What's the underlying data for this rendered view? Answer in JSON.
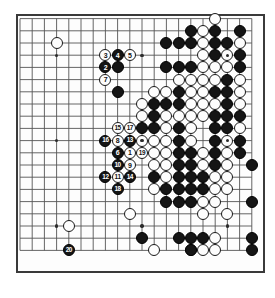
{
  "diagram": {
    "kind": "go-board-game-record",
    "board_size": 20,
    "origin_x": 20.0,
    "origin_y": 18.6,
    "spacing": 12.2,
    "stone_radius": 6.0,
    "colors": {
      "black": "#151515",
      "white": "#fdfdfd",
      "line": "#555555",
      "border": "#3a3a3a",
      "background": "#ffffff"
    },
    "star_points": [
      {
        "col": 3,
        "row": 3
      },
      {
        "col": 10,
        "row": 3
      },
      {
        "col": 17,
        "row": 3
      },
      {
        "col": 3,
        "row": 10
      },
      {
        "col": 10,
        "row": 10
      },
      {
        "col": 17,
        "row": 10
      },
      {
        "col": 3,
        "row": 17
      },
      {
        "col": 10,
        "row": 17
      },
      {
        "col": 17,
        "row": 17
      }
    ],
    "moves": [
      {
        "n": "1",
        "color": "w",
        "col": 9,
        "row": 11
      },
      {
        "n": "2",
        "color": "b",
        "col": 7,
        "row": 4
      },
      {
        "n": "3",
        "color": "w",
        "col": 7,
        "row": 3
      },
      {
        "n": "4",
        "color": "b",
        "col": 8,
        "row": 3
      },
      {
        "n": "5",
        "color": "w",
        "col": 9,
        "row": 3
      },
      {
        "n": "6",
        "color": "b",
        "col": 8,
        "row": 11
      },
      {
        "n": "7",
        "color": "w",
        "col": 7,
        "row": 5
      },
      {
        "n": "8",
        "color": "w",
        "col": 8,
        "row": 10
      },
      {
        "n": "9",
        "color": "w",
        "col": 9,
        "row": 12
      },
      {
        "n": "10",
        "color": "b",
        "col": 8,
        "row": 12
      },
      {
        "n": "11",
        "color": "w",
        "col": 8,
        "row": 13
      },
      {
        "n": "12",
        "color": "b",
        "col": 7,
        "row": 13
      },
      {
        "n": "13",
        "color": "b",
        "col": 9,
        "row": 10
      },
      {
        "n": "14",
        "color": "b",
        "col": 9,
        "row": 13
      },
      {
        "n": "15",
        "color": "w",
        "col": 8,
        "row": 9
      },
      {
        "n": "16",
        "color": "b",
        "col": 7,
        "row": 10
      },
      {
        "n": "17",
        "color": "w",
        "col": 9,
        "row": 9
      },
      {
        "n": "18",
        "color": "b",
        "col": 8,
        "row": 14
      },
      {
        "n": "19",
        "color": "w",
        "col": 10,
        "row": 11
      },
      {
        "n": "20",
        "color": "b",
        "col": 4,
        "row": 19
      }
    ],
    "stones": [
      {
        "color": "w",
        "col": 3,
        "row": 2
      },
      {
        "color": "w",
        "col": 16,
        "row": 0
      },
      {
        "color": "b",
        "col": 14,
        "row": 1
      },
      {
        "color": "w",
        "col": 15,
        "row": 1
      },
      {
        "color": "b",
        "col": 16,
        "row": 1
      },
      {
        "color": "b",
        "col": 18,
        "row": 1
      },
      {
        "color": "b",
        "col": 12,
        "row": 2
      },
      {
        "color": "b",
        "col": 13,
        "row": 2
      },
      {
        "color": "b",
        "col": 14,
        "row": 2
      },
      {
        "color": "w",
        "col": 15,
        "row": 2
      },
      {
        "color": "b",
        "col": 16,
        "row": 2
      },
      {
        "color": "b",
        "col": 17,
        "row": 2
      },
      {
        "color": "w",
        "col": 18,
        "row": 2
      },
      {
        "color": "b",
        "col": 8,
        "row": 4
      },
      {
        "color": "w",
        "col": 15,
        "row": 3
      },
      {
        "color": "b",
        "col": 16,
        "row": 3
      },
      {
        "color": "w",
        "col": 17,
        "row": 3
      },
      {
        "color": "b",
        "col": 18,
        "row": 3
      },
      {
        "color": "b",
        "col": 12,
        "row": 4
      },
      {
        "color": "b",
        "col": 13,
        "row": 4
      },
      {
        "color": "b",
        "col": 14,
        "row": 4
      },
      {
        "color": "w",
        "col": 15,
        "row": 4
      },
      {
        "color": "w",
        "col": 16,
        "row": 4
      },
      {
        "color": "w",
        "col": 17,
        "row": 4
      },
      {
        "color": "b",
        "col": 18,
        "row": 4
      },
      {
        "color": "b",
        "col": 8,
        "row": 6
      },
      {
        "color": "w",
        "col": 13,
        "row": 5
      },
      {
        "color": "w",
        "col": 14,
        "row": 5
      },
      {
        "color": "w",
        "col": 15,
        "row": 5
      },
      {
        "color": "w",
        "col": 16,
        "row": 5
      },
      {
        "color": "b",
        "col": 17,
        "row": 5
      },
      {
        "color": "w",
        "col": 18,
        "row": 5
      },
      {
        "color": "w",
        "col": 11,
        "row": 6
      },
      {
        "color": "w",
        "col": 12,
        "row": 6
      },
      {
        "color": "b",
        "col": 13,
        "row": 6
      },
      {
        "color": "w",
        "col": 14,
        "row": 6
      },
      {
        "color": "w",
        "col": 15,
        "row": 6
      },
      {
        "color": "b",
        "col": 16,
        "row": 6
      },
      {
        "color": "b",
        "col": 17,
        "row": 6
      },
      {
        "color": "w",
        "col": 18,
        "row": 6
      },
      {
        "color": "w",
        "col": 10,
        "row": 7
      },
      {
        "color": "b",
        "col": 11,
        "row": 7
      },
      {
        "color": "b",
        "col": 12,
        "row": 7
      },
      {
        "color": "b",
        "col": 13,
        "row": 7
      },
      {
        "color": "w",
        "col": 14,
        "row": 7
      },
      {
        "color": "w",
        "col": 15,
        "row": 7
      },
      {
        "color": "w",
        "col": 16,
        "row": 7
      },
      {
        "color": "b",
        "col": 17,
        "row": 7
      },
      {
        "color": "w",
        "col": 18,
        "row": 7
      },
      {
        "color": "w",
        "col": 10,
        "row": 8
      },
      {
        "color": "b",
        "col": 11,
        "row": 8
      },
      {
        "color": "w",
        "col": 12,
        "row": 8
      },
      {
        "color": "w",
        "col": 13,
        "row": 8
      },
      {
        "color": "w",
        "col": 14,
        "row": 8
      },
      {
        "color": "w",
        "col": 15,
        "row": 8
      },
      {
        "color": "b",
        "col": 16,
        "row": 8
      },
      {
        "color": "b",
        "col": 17,
        "row": 8
      },
      {
        "color": "b",
        "col": 18,
        "row": 8
      },
      {
        "color": "b",
        "col": 10,
        "row": 9
      },
      {
        "color": "b",
        "col": 11,
        "row": 9
      },
      {
        "color": "w",
        "col": 12,
        "row": 9
      },
      {
        "color": "b",
        "col": 13,
        "row": 9
      },
      {
        "color": "w",
        "col": 14,
        "row": 9
      },
      {
        "color": "b",
        "col": 16,
        "row": 9
      },
      {
        "color": "b",
        "col": 17,
        "row": 9
      },
      {
        "color": "w",
        "col": 18,
        "row": 9
      },
      {
        "color": "w",
        "col": 10,
        "row": 10
      },
      {
        "color": "w",
        "col": 11,
        "row": 10
      },
      {
        "color": "w",
        "col": 12,
        "row": 10
      },
      {
        "color": "b",
        "col": 13,
        "row": 10
      },
      {
        "color": "w",
        "col": 14,
        "row": 10
      },
      {
        "color": "b",
        "col": 16,
        "row": 10
      },
      {
        "color": "w",
        "col": 17,
        "row": 10
      },
      {
        "color": "b",
        "col": 18,
        "row": 10
      },
      {
        "color": "w",
        "col": 11,
        "row": 11
      },
      {
        "color": "w",
        "col": 12,
        "row": 11
      },
      {
        "color": "b",
        "col": 13,
        "row": 11
      },
      {
        "color": "b",
        "col": 14,
        "row": 11
      },
      {
        "color": "w",
        "col": 15,
        "row": 11
      },
      {
        "color": "b",
        "col": 16,
        "row": 11
      },
      {
        "color": "w",
        "col": 17,
        "row": 11
      },
      {
        "color": "b",
        "col": 18,
        "row": 11
      },
      {
        "color": "w",
        "col": 11,
        "row": 12
      },
      {
        "color": "w",
        "col": 12,
        "row": 12
      },
      {
        "color": "b",
        "col": 13,
        "row": 12
      },
      {
        "color": "b",
        "col": 14,
        "row": 12
      },
      {
        "color": "w",
        "col": 15,
        "row": 12
      },
      {
        "color": "b",
        "col": 16,
        "row": 12
      },
      {
        "color": "w",
        "col": 17,
        "row": 12
      },
      {
        "color": "b",
        "col": 11,
        "row": 13
      },
      {
        "color": "w",
        "col": 12,
        "row": 13
      },
      {
        "color": "b",
        "col": 13,
        "row": 13
      },
      {
        "color": "b",
        "col": 14,
        "row": 13
      },
      {
        "color": "b",
        "col": 15,
        "row": 13
      },
      {
        "color": "w",
        "col": 16,
        "row": 13
      },
      {
        "color": "w",
        "col": 17,
        "row": 13
      },
      {
        "color": "w",
        "col": 11,
        "row": 14
      },
      {
        "color": "b",
        "col": 12,
        "row": 14
      },
      {
        "color": "b",
        "col": 13,
        "row": 14
      },
      {
        "color": "b",
        "col": 14,
        "row": 14
      },
      {
        "color": "b",
        "col": 15,
        "row": 14
      },
      {
        "color": "w",
        "col": 16,
        "row": 14
      },
      {
        "color": "w",
        "col": 17,
        "row": 14
      },
      {
        "color": "b",
        "col": 12,
        "row": 15
      },
      {
        "color": "b",
        "col": 13,
        "row": 15
      },
      {
        "color": "b",
        "col": 14,
        "row": 15
      },
      {
        "color": "w",
        "col": 15,
        "row": 15
      },
      {
        "color": "w",
        "col": 16,
        "row": 15
      },
      {
        "color": "b",
        "col": 19,
        "row": 12
      },
      {
        "color": "b",
        "col": 19,
        "row": 15
      },
      {
        "color": "w",
        "col": 9,
        "row": 16
      },
      {
        "color": "w",
        "col": 15,
        "row": 16
      },
      {
        "color": "w",
        "col": 17,
        "row": 16
      },
      {
        "color": "b",
        "col": 10,
        "row": 18
      },
      {
        "color": "b",
        "col": 13,
        "row": 18
      },
      {
        "color": "b",
        "col": 14,
        "row": 18
      },
      {
        "color": "b",
        "col": 15,
        "row": 18
      },
      {
        "color": "w",
        "col": 16,
        "row": 18
      },
      {
        "color": "w",
        "col": 14,
        "row": 19
      },
      {
        "color": "b",
        "col": 14,
        "row": 19
      },
      {
        "color": "w",
        "col": 15,
        "row": 19
      },
      {
        "color": "w",
        "col": 16,
        "row": 19
      },
      {
        "color": "w",
        "col": 4,
        "row": 17
      },
      {
        "color": "w",
        "col": 11,
        "row": 19
      },
      {
        "color": "b",
        "col": 19,
        "row": 18
      },
      {
        "color": "b",
        "col": 19,
        "row": 19
      }
    ]
  }
}
